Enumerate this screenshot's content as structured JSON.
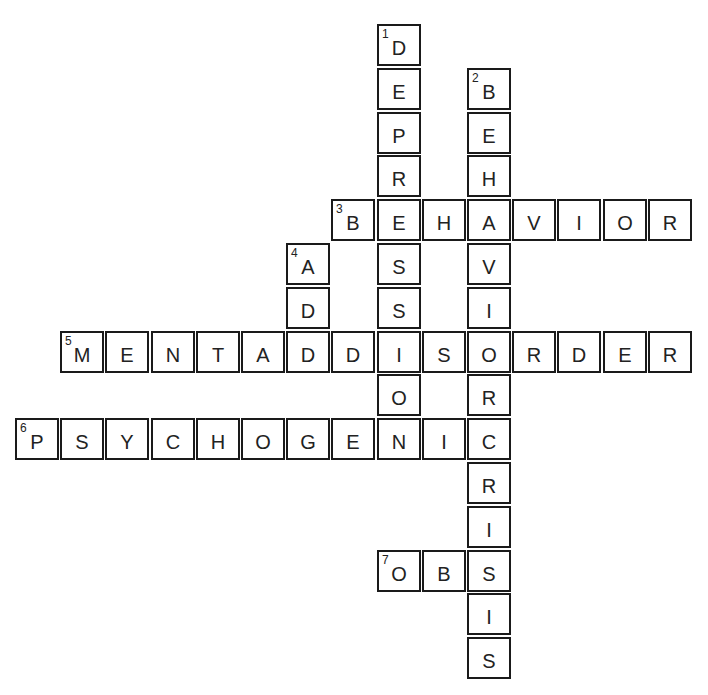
{
  "puzzle": {
    "origin_x": 15,
    "origin_y": 24,
    "pitch_x": 45.2,
    "pitch_y": 43.8,
    "entries": [
      {
        "number": 1,
        "direction": "down",
        "answer": "DEPRESSION",
        "row": 0,
        "col": 8
      },
      {
        "number": 2,
        "direction": "down",
        "answer": "BEHAVIORCRISIS",
        "row": 1,
        "col": 10
      },
      {
        "number": 3,
        "direction": "across",
        "answer": "BEHAVIOR",
        "row": 4,
        "col": 7
      },
      {
        "number": 4,
        "direction": "down",
        "answer": "ADD",
        "row": 5,
        "col": 6
      },
      {
        "number": 5,
        "direction": "across",
        "answer": "MENTALDISORDER",
        "row": 7,
        "col": 1
      },
      {
        "number": 6,
        "direction": "across",
        "answer": "PSYCHOGENIC",
        "row": 9,
        "col": 0
      },
      {
        "number": 7,
        "direction": "across",
        "answer": "OBS",
        "row": 12,
        "col": 8
      }
    ]
  }
}
